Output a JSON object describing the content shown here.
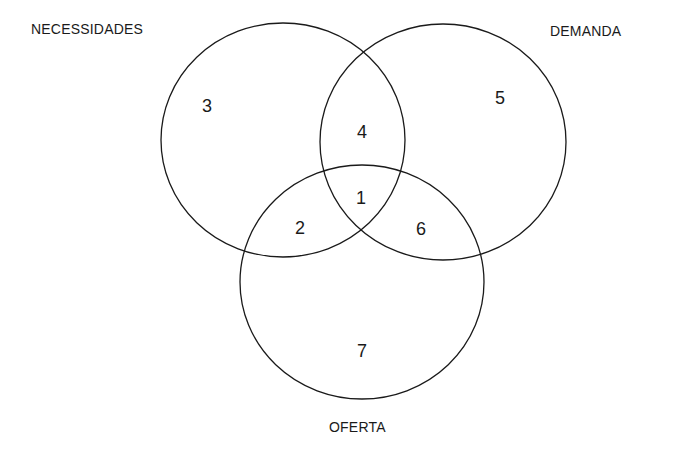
{
  "diagram": {
    "type": "venn",
    "sets": [
      {
        "id": "necessidades",
        "label": "NECESSIDADES",
        "cx": 283,
        "cy": 140,
        "rx": 122,
        "ry": 117
      },
      {
        "id": "demanda",
        "label": "DEMANDA",
        "cx": 443,
        "cy": 142,
        "rx": 123,
        "ry": 118
      },
      {
        "id": "oferta",
        "label": "OFERTA",
        "cx": 362,
        "cy": 282,
        "rx": 122,
        "ry": 117
      }
    ],
    "regions": [
      {
        "number": "1",
        "sets": [
          "necessidades",
          "demanda",
          "oferta"
        ],
        "x": 361,
        "y": 198
      },
      {
        "number": "2",
        "sets": [
          "necessidades",
          "oferta"
        ],
        "x": 300,
        "y": 228
      },
      {
        "number": "3",
        "sets": [
          "necessidades"
        ],
        "x": 207,
        "y": 106
      },
      {
        "number": "4",
        "sets": [
          "necessidades",
          "demanda"
        ],
        "x": 362,
        "y": 132
      },
      {
        "number": "5",
        "sets": [
          "demanda"
        ],
        "x": 500,
        "y": 98
      },
      {
        "number": "6",
        "sets": [
          "demanda",
          "oferta"
        ],
        "x": 421,
        "y": 229
      },
      {
        "number": "7",
        "sets": [
          "oferta"
        ],
        "x": 362,
        "y": 351
      }
    ],
    "stroke_color": "#1a1a1a"
  }
}
